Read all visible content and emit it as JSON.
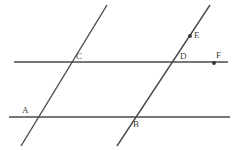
{
  "figure": {
    "canvas": {
      "width": 238,
      "height": 150
    },
    "style": {
      "background_color": "#ffffff",
      "line_color": "#4a4a4a",
      "label_color": "#3f3f3f",
      "marker_color": "#333333",
      "line_width": 1.4,
      "label_font_size": 9
    },
    "lines": [
      {
        "name": "upper-horizontal-line",
        "kind": "horizontal",
        "x1": 14,
        "y1": 62,
        "x2": 228,
        "y2": 62
      },
      {
        "name": "lower-horizontal-line",
        "kind": "horizontal",
        "x1": 9,
        "y1": 117,
        "x2": 230,
        "y2": 117
      },
      {
        "name": "left-transversal-line",
        "kind": "diagonal",
        "x1": 107,
        "y1": 5,
        "x2": 21,
        "y2": 146
      },
      {
        "name": "right-transversal-line",
        "kind": "diagonal",
        "x1": 210,
        "y1": 5,
        "x2": 117,
        "y2": 146
      }
    ],
    "markers": [
      {
        "name": "point-marker-e",
        "label": "E",
        "x": 190,
        "y": 36,
        "radius": 1.9
      },
      {
        "name": "point-marker-f",
        "label": "F",
        "x": 214,
        "y": 63,
        "radius": 1.9
      }
    ],
    "labels": [
      {
        "name": "point-label-a",
        "text": "A",
        "x": 22,
        "y": 106
      },
      {
        "name": "point-label-b",
        "text": "B",
        "x": 133,
        "y": 120
      },
      {
        "name": "point-label-c",
        "text": "C",
        "x": 76,
        "y": 52
      },
      {
        "name": "point-label-d",
        "text": "D",
        "x": 180,
        "y": 52
      },
      {
        "name": "point-label-e",
        "text": "E",
        "x": 194,
        "y": 31
      },
      {
        "name": "point-label-f",
        "text": "F",
        "x": 216,
        "y": 51
      }
    ],
    "intersections": [
      {
        "name": "intersection-c",
        "label": "C",
        "x": 72,
        "y": 62
      },
      {
        "name": "intersection-d",
        "label": "D",
        "x": 175,
        "y": 62
      },
      {
        "name": "intersection-a",
        "label": "A",
        "x": 30,
        "y": 117
      },
      {
        "name": "intersection-b",
        "label": "B",
        "x": 128,
        "y": 117
      }
    ]
  }
}
